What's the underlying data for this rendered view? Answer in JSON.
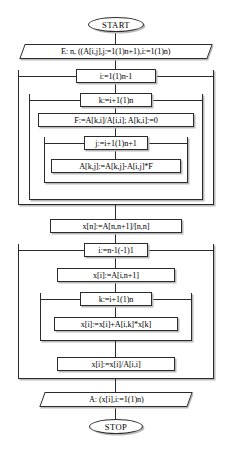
{
  "diagram": {
    "colors": {
      "stroke": "#2b2b2b",
      "shadow": "#b9b9b9",
      "background": "#ffffff",
      "text": "#000000"
    }
  },
  "nodes": {
    "start": "START",
    "input": "E: n, ((A[i,j],j:=1(1)n+1),i:=1(1)n)",
    "loop_i_forward": "i:=1(1)n-1",
    "loop_k_forward": "k:=i+1(1)n",
    "factor_assign": "F:=A[k,i]/A[i,i];  A[k,i]:=0",
    "loop_j": "j:=i+1(1)n+1",
    "row_update": "A[k,j]:=A[k,j]-A[i,j]*F",
    "back_sub_init": "x[n]:=A[n,n+1]/[n,n]",
    "loop_i_backward": "i:=n-1(-1)1",
    "x_init": "x[i]:=A[i,n+1]",
    "loop_k_backward": "k:=i+1(1)n",
    "x_accumulate": "x[i]:=x[i]+A[i,k]*x[k]",
    "x_divide": "x[i]:=x[i]/A[i,i]",
    "output": "A: (x[i],i:=1(1)n)",
    "stop": "STOP"
  }
}
